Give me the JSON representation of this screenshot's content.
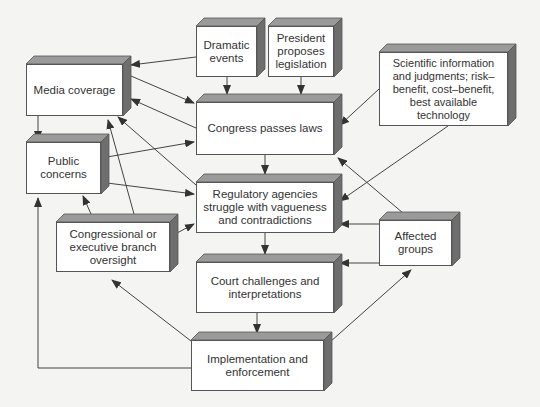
{
  "diagram": {
    "type": "flowchart",
    "nodes": [
      {
        "id": "dramatic",
        "label": "Dramatic events"
      },
      {
        "id": "president",
        "label": "President proposes legislation"
      },
      {
        "id": "media",
        "label": "Media coverage"
      },
      {
        "id": "congress",
        "label": "Congress passes laws"
      },
      {
        "id": "public",
        "label": "Public concerns"
      },
      {
        "id": "scientific",
        "label": "Scientific information and judgments; risk–benefit, cost–benefit, best available technology"
      },
      {
        "id": "regulatory",
        "label": "Regulatory agencies struggle with vagueness and contradictions"
      },
      {
        "id": "oversight",
        "label": "Congressional or executive branch oversight"
      },
      {
        "id": "affected",
        "label": "Affected groups"
      },
      {
        "id": "court",
        "label": "Court challenges and interpretations"
      },
      {
        "id": "implementation",
        "label": "Implementation and enforcement"
      }
    ],
    "edges": [
      {
        "from": "dramatic",
        "to": "media"
      },
      {
        "from": "dramatic",
        "to": "congress"
      },
      {
        "from": "president",
        "to": "congress"
      },
      {
        "from": "media",
        "to": "congress"
      },
      {
        "from": "congress",
        "to": "media"
      },
      {
        "from": "media",
        "to": "public"
      },
      {
        "from": "public",
        "to": "congress"
      },
      {
        "from": "public",
        "to": "regulatory"
      },
      {
        "from": "regulatory",
        "to": "media"
      },
      {
        "from": "oversight",
        "to": "media"
      },
      {
        "from": "oversight",
        "to": "public"
      },
      {
        "from": "oversight",
        "to": "regulatory"
      },
      {
        "from": "scientific",
        "to": "congress"
      },
      {
        "from": "scientific",
        "to": "regulatory"
      },
      {
        "from": "congress",
        "to": "regulatory"
      },
      {
        "from": "regulatory",
        "to": "court"
      },
      {
        "from": "affected",
        "to": "congress"
      },
      {
        "from": "affected",
        "to": "regulatory"
      },
      {
        "from": "affected",
        "to": "court"
      },
      {
        "from": "court",
        "to": "implementation"
      },
      {
        "from": "implementation",
        "to": "oversight"
      },
      {
        "from": "implementation",
        "to": "affected"
      },
      {
        "from": "implementation",
        "to": "public"
      }
    ]
  },
  "colors": {
    "box_face": "#ffffff",
    "box_top": "#9a9a9a",
    "box_side": "#6e6e6e",
    "line": "#444444",
    "text": "#333333",
    "background": "#f4f4f2"
  }
}
